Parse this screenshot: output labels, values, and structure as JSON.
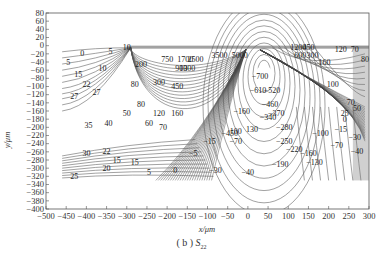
{
  "chart_data": {
    "type": "contour",
    "caption_prefix": "( b )",
    "caption_symbol": "S",
    "caption_subscript": "22",
    "xlabel": "x/μm",
    "ylabel": "y/μm",
    "xlim": [
      -500,
      300
    ],
    "ylim": [
      -400,
      80
    ],
    "grid": false,
    "x_ticks": [
      -500,
      -450,
      -400,
      -350,
      -300,
      -250,
      -200,
      -150,
      -100,
      -50,
      0,
      50,
      100,
      150,
      200,
      250,
      300
    ],
    "y_ticks": [
      80,
      60,
      40,
      20,
      0,
      -20,
      -40,
      -60,
      -80,
      -100,
      -120,
      -140,
      -160,
      -180,
      -200,
      -220,
      -240,
      -260,
      -280,
      -300,
      -320,
      -340,
      -360,
      -380,
      -400
    ],
    "contour_labels": [
      {
        "value": "0",
        "x": -410,
        "y": -20
      },
      {
        "value": "5",
        "x": -445,
        "y": -40
      },
      {
        "value": "5",
        "x": -340,
        "y": -15
      },
      {
        "value": "10",
        "x": -300,
        "y": -5
      },
      {
        "value": "10",
        "x": -360,
        "y": -55
      },
      {
        "value": "15",
        "x": -420,
        "y": -70
      },
      {
        "value": "22",
        "x": -400,
        "y": -95
      },
      {
        "value": "27",
        "x": -375,
        "y": -115
      },
      {
        "value": "27",
        "x": -430,
        "y": -125
      },
      {
        "value": "35",
        "x": -395,
        "y": -195
      },
      {
        "value": "40",
        "x": -345,
        "y": -190
      },
      {
        "value": "50",
        "x": -300,
        "y": -165
      },
      {
        "value": "60",
        "x": -245,
        "y": -190
      },
      {
        "value": "70",
        "x": -210,
        "y": -200
      },
      {
        "value": "80",
        "x": -265,
        "y": -145
      },
      {
        "value": "80",
        "x": -280,
        "y": -95
      },
      {
        "value": "120",
        "x": -220,
        "y": -165
      },
      {
        "value": "160",
        "x": -175,
        "y": -165
      },
      {
        "value": "200",
        "x": -265,
        "y": -45
      },
      {
        "value": "300",
        "x": -220,
        "y": -90
      },
      {
        "value": "450",
        "x": -175,
        "y": -100
      },
      {
        "value": "750",
        "x": -200,
        "y": -35
      },
      {
        "value": "900",
        "x": -165,
        "y": -55
      },
      {
        "value": "1300",
        "x": -150,
        "y": -55
      },
      {
        "value": "1700",
        "x": -155,
        "y": -35
      },
      {
        "value": "2500",
        "x": -130,
        "y": -35
      },
      {
        "value": "3500",
        "x": -70,
        "y": -25
      },
      {
        "value": "5000",
        "x": -20,
        "y": -25
      },
      {
        "value": "-160",
        "x": -15,
        "y": -160
      },
      {
        "value": "-700",
        "x": 30,
        "y": -75
      },
      {
        "value": "-610",
        "x": 25,
        "y": -110
      },
      {
        "value": "-520",
        "x": 60,
        "y": -110
      },
      {
        "value": "-460",
        "x": 55,
        "y": -145
      },
      {
        "value": "-370",
        "x": 70,
        "y": -165
      },
      {
        "value": "-340",
        "x": 50,
        "y": -175
      },
      {
        "value": "-450",
        "x": -45,
        "y": -215
      },
      {
        "value": "-280",
        "x": 90,
        "y": -200
      },
      {
        "value": "-250",
        "x": 90,
        "y": -235
      },
      {
        "value": "-220",
        "x": 115,
        "y": -255
      },
      {
        "value": "-190",
        "x": 80,
        "y": -290
      },
      {
        "value": "-160",
        "x": 150,
        "y": -265
      },
      {
        "value": "-130",
        "x": 165,
        "y": -285
      },
      {
        "value": "-100",
        "x": 180,
        "y": -215
      },
      {
        "value": "-70",
        "x": 220,
        "y": -245
      },
      {
        "value": "-70",
        "x": -30,
        "y": -235
      },
      {
        "value": "-40",
        "x": 270,
        "y": -260
      },
      {
        "value": "-40",
        "x": 0,
        "y": -310
      },
      {
        "value": "-30",
        "x": -80,
        "y": -305
      },
      {
        "value": "-30",
        "x": 265,
        "y": -225
      },
      {
        "value": "-15",
        "x": 230,
        "y": -205
      },
      {
        "value": "-15",
        "x": -95,
        "y": -235
      },
      {
        "value": "-5",
        "x": -135,
        "y": -265
      },
      {
        "value": "0",
        "x": -180,
        "y": -305
      },
      {
        "value": "5",
        "x": -245,
        "y": -310
      },
      {
        "value": "15",
        "x": -280,
        "y": -285
      },
      {
        "value": "15",
        "x": -325,
        "y": -280
      },
      {
        "value": "20",
        "x": -350,
        "y": -300
      },
      {
        "value": "22",
        "x": -350,
        "y": -260
      },
      {
        "value": "25",
        "x": -430,
        "y": -320
      },
      {
        "value": "30",
        "x": -400,
        "y": -265
      },
      {
        "value": "100",
        "x": -30,
        "y": -210
      },
      {
        "value": "130",
        "x": 10,
        "y": -205
      },
      {
        "value": "1200",
        "x": 125,
        "y": -5
      },
      {
        "value": "450",
        "x": 150,
        "y": -5
      },
      {
        "value": "600",
        "x": 130,
        "y": -25
      },
      {
        "value": "300",
        "x": 160,
        "y": -25
      },
      {
        "value": "160",
        "x": 190,
        "y": -40
      },
      {
        "value": "120",
        "x": 230,
        "y": -10
      },
      {
        "value": "70",
        "x": 265,
        "y": -10
      },
      {
        "value": "80",
        "x": 290,
        "y": -35
      },
      {
        "value": "100",
        "x": 210,
        "y": -95
      },
      {
        "value": "70",
        "x": 255,
        "y": -140
      },
      {
        "value": "50",
        "x": 270,
        "y": -155
      },
      {
        "value": "25",
        "x": 240,
        "y": -165
      },
      {
        "value": "0",
        "x": 240,
        "y": -180
      }
    ],
    "annotations": [
      "Stress concentration peak near x≈0 to 50 μm at surface (y≈0)",
      "Compressive minimum near (40, -75) labeled -700"
    ]
  },
  "axes": {
    "xlabel": "x/μm",
    "ylabel": "y/μm"
  },
  "caption": {
    "prefix": "( b )",
    "symbol": "S",
    "subscript": "22"
  }
}
